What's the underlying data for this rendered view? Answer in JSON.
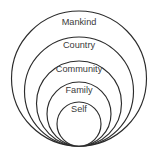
{
  "diagram": {
    "type": "nested-circles",
    "canvas": {
      "width": 157,
      "height": 167
    },
    "background_color": "#ffffff",
    "stroke_color": "#2b2b2b",
    "label_color": "#3a3a3a",
    "rings": [
      {
        "id": "mankind",
        "label": "Mankind",
        "level": 1,
        "cx": 79,
        "cy": 78.5,
        "r": 67.5,
        "label_x": 79,
        "label_y": 23
      },
      {
        "id": "country",
        "label": "Country",
        "level": 2,
        "cx": 79,
        "cy": 91.5,
        "r": 54.5,
        "label_x": 79,
        "label_y": 46
      },
      {
        "id": "community",
        "label": "Community",
        "level": 3,
        "cx": 79,
        "cy": 103.5,
        "r": 42.5,
        "label_x": 79,
        "label_y": 70
      },
      {
        "id": "family",
        "label": "Family",
        "level": 4,
        "cx": 79,
        "cy": 114.0,
        "r": 32.0,
        "label_x": 79,
        "label_y": 91
      },
      {
        "id": "self",
        "label": "Self",
        "level": 5,
        "cx": 79,
        "cy": 124.0,
        "r": 22.0,
        "label_x": 79,
        "label_y": 110
      }
    ]
  }
}
